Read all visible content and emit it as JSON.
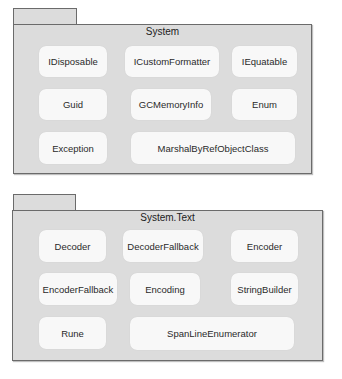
{
  "packages": [
    {
      "name": "System",
      "classes": [
        "IDisposable",
        "ICustomFormatter",
        "IEquatable",
        "Guid",
        "GCMemoryInfo",
        "Enum",
        "Exception",
        "MarshalByRefObjectClass"
      ]
    },
    {
      "name": "System.Text",
      "classes": [
        "Decoder",
        "DecoderFallback",
        "Encoder",
        "EncoderFallback",
        "Encoding",
        "StringBuilder",
        "Rune",
        "SpanLineEnumerator"
      ]
    }
  ]
}
